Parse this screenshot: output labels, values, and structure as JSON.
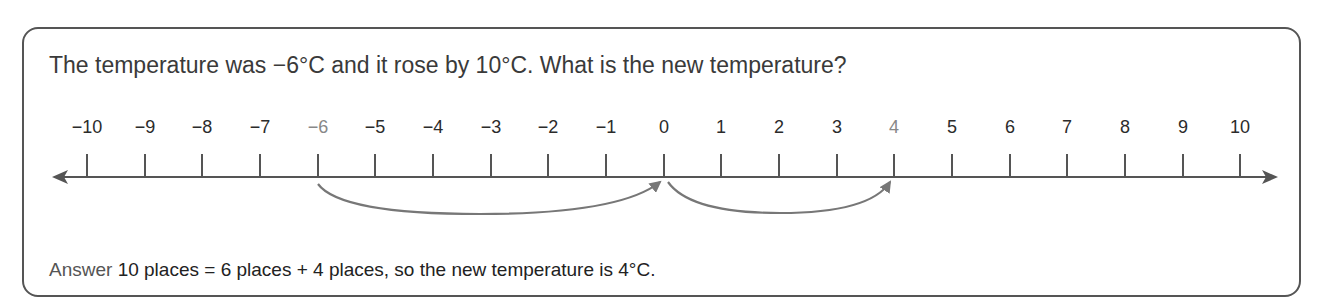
{
  "question": "The temperature was −6°C and it rose by 10°C. What is the new temperature?",
  "number_line": {
    "labels": [
      "−10",
      "−9",
      "−8",
      "−7",
      "−6",
      "−5",
      "−4",
      "−3",
      "−2",
      "−1",
      "0",
      "1",
      "2",
      "3",
      "4",
      "5",
      "6",
      "7",
      "8",
      "9",
      "10"
    ],
    "highlighted": [
      "−6",
      "4"
    ],
    "jumps": [
      {
        "from": "−6",
        "to": "0",
        "size": 6
      },
      {
        "from": "0",
        "to": "4",
        "size": 4
      }
    ],
    "colors": {
      "line": "#555555",
      "arc": "#777777",
      "highlight_label": "#888888"
    }
  },
  "answer": {
    "prefix": "Answer",
    "text": "10 places = 6 places + 4 places, so the new temperature is 4°C."
  }
}
